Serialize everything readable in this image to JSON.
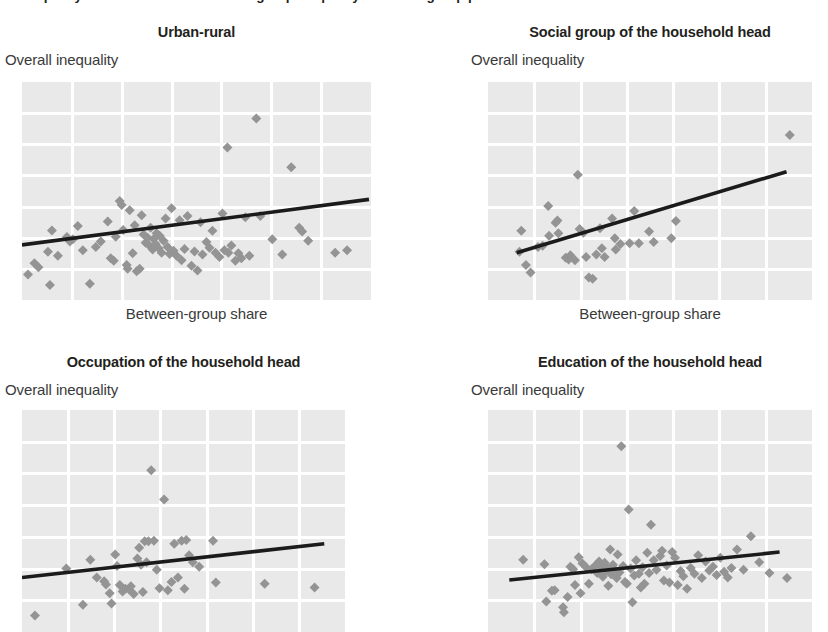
{
  "figure": {
    "caption": "Inequality is correlated with between-group inequality in all four group partitions",
    "y_axis_label": "Overall inequality",
    "x_axis_label": "Between-group share",
    "colors": {
      "plot_background": "#e9e9e9",
      "gridline": "#ffffff",
      "marker": "#949494",
      "trendline": "#1b1b1b",
      "text": "#231f20"
    }
  },
  "chart_data": [
    {
      "type": "scatter",
      "panel": 1,
      "title": "Urban-rural",
      "xlabel": "Between-group share",
      "ylabel": "Overall inequality",
      "grid": true,
      "legend": null,
      "xlim": [
        0,
        7
      ],
      "ylim": [
        0,
        7
      ],
      "grid_cols": 7,
      "grid_rows": 7,
      "trendline": {
        "x0": 0.0,
        "y0": 1.77,
        "x1": 6.96,
        "y1": 3.23
      },
      "points": [
        [
          0.12,
          0.82
        ],
        [
          0.25,
          1.18
        ],
        [
          0.33,
          1.05
        ],
        [
          0.52,
          1.55
        ],
        [
          0.56,
          0.48
        ],
        [
          0.6,
          2.23
        ],
        [
          0.72,
          1.42
        ],
        [
          0.9,
          2.02
        ],
        [
          0.96,
          1.88
        ],
        [
          1.02,
          1.95
        ],
        [
          1.12,
          2.38
        ],
        [
          1.22,
          1.6
        ],
        [
          1.36,
          0.52
        ],
        [
          1.48,
          1.7
        ],
        [
          1.58,
          1.88
        ],
        [
          1.72,
          2.52
        ],
        [
          1.78,
          1.34
        ],
        [
          1.84,
          1.26
        ],
        [
          1.88,
          2.03
        ],
        [
          1.96,
          3.18
        ],
        [
          2.0,
          3.05
        ],
        [
          2.03,
          2.25
        ],
        [
          2.1,
          1.12
        ],
        [
          2.12,
          1.0
        ],
        [
          2.16,
          2.88
        ],
        [
          2.22,
          1.5
        ],
        [
          2.26,
          2.4
        ],
        [
          2.3,
          0.92
        ],
        [
          2.36,
          1.0
        ],
        [
          2.4,
          2.72
        ],
        [
          2.44,
          2.1
        ],
        [
          2.48,
          1.84
        ],
        [
          2.52,
          2.0
        ],
        [
          2.56,
          1.74
        ],
        [
          2.58,
          2.32
        ],
        [
          2.62,
          1.62
        ],
        [
          2.64,
          1.96
        ],
        [
          2.68,
          1.8
        ],
        [
          2.7,
          2.14
        ],
        [
          2.74,
          1.66
        ],
        [
          2.76,
          2.06
        ],
        [
          2.8,
          1.52
        ],
        [
          2.84,
          1.9
        ],
        [
          2.88,
          2.62
        ],
        [
          2.92,
          1.7
        ],
        [
          2.96,
          1.48
        ],
        [
          3.0,
          2.95
        ],
        [
          3.04,
          1.58
        ],
        [
          3.1,
          1.42
        ],
        [
          3.16,
          2.56
        ],
        [
          3.2,
          1.28
        ],
        [
          3.26,
          1.64
        ],
        [
          3.32,
          2.7
        ],
        [
          3.4,
          1.1
        ],
        [
          3.46,
          1.56
        ],
        [
          3.52,
          0.95
        ],
        [
          3.58,
          2.5
        ],
        [
          3.62,
          1.46
        ],
        [
          3.7,
          1.86
        ],
        [
          3.76,
          1.68
        ],
        [
          3.82,
          2.22
        ],
        [
          3.88,
          1.52
        ],
        [
          3.96,
          1.38
        ],
        [
          4.02,
          2.78
        ],
        [
          4.06,
          1.6
        ],
        [
          4.12,
          4.9
        ],
        [
          4.14,
          1.52
        ],
        [
          4.2,
          1.75
        ],
        [
          4.28,
          1.26
        ],
        [
          4.34,
          1.5
        ],
        [
          4.4,
          1.34
        ],
        [
          4.48,
          2.66
        ],
        [
          4.56,
          1.42
        ],
        [
          4.7,
          5.83
        ],
        [
          4.78,
          2.7
        ],
        [
          5.02,
          1.95
        ],
        [
          5.22,
          1.46
        ],
        [
          5.4,
          4.26
        ],
        [
          5.56,
          2.32
        ],
        [
          5.62,
          2.2
        ],
        [
          5.74,
          1.9
        ],
        [
          6.28,
          1.52
        ],
        [
          6.52,
          1.6
        ]
      ]
    },
    {
      "type": "scatter",
      "panel": 2,
      "title": "Social group of the household head",
      "xlabel": "Between-group share",
      "ylabel": "Overall inequality",
      "grid": true,
      "legend": null,
      "xlim": [
        0,
        7
      ],
      "ylim": [
        0,
        7
      ],
      "grid_cols": 7,
      "grid_rows": 7,
      "trendline": {
        "x0": 0.62,
        "y0": 1.52,
        "x1": 6.45,
        "y1": 4.12
      },
      "points": [
        [
          0.68,
          1.55
        ],
        [
          0.72,
          2.22
        ],
        [
          0.82,
          1.12
        ],
        [
          0.92,
          0.88
        ],
        [
          1.08,
          1.7
        ],
        [
          1.18,
          1.74
        ],
        [
          1.3,
          3.02
        ],
        [
          1.32,
          2.06
        ],
        [
          1.46,
          2.48
        ],
        [
          1.5,
          2.55
        ],
        [
          1.52,
          2.14
        ],
        [
          1.68,
          1.36
        ],
        [
          1.74,
          1.3
        ],
        [
          1.78,
          1.44
        ],
        [
          1.88,
          1.28
        ],
        [
          1.94,
          4.02
        ],
        [
          1.98,
          2.28
        ],
        [
          2.06,
          2.16
        ],
        [
          2.12,
          1.38
        ],
        [
          2.18,
          0.72
        ],
        [
          2.26,
          0.68
        ],
        [
          2.34,
          1.46
        ],
        [
          2.42,
          2.3
        ],
        [
          2.46,
          1.66
        ],
        [
          2.52,
          1.38
        ],
        [
          2.68,
          2.62
        ],
        [
          2.74,
          1.98
        ],
        [
          2.76,
          1.62
        ],
        [
          2.86,
          1.8
        ],
        [
          3.06,
          1.82
        ],
        [
          3.16,
          2.86
        ],
        [
          3.26,
          1.82
        ],
        [
          3.48,
          2.2
        ],
        [
          3.58,
          1.86
        ],
        [
          3.96,
          1.98
        ],
        [
          4.06,
          2.54
        ],
        [
          6.52,
          5.3
        ]
      ]
    },
    {
      "type": "scatter",
      "panel": 3,
      "title": "Occupation of the household head",
      "xlabel": "Between-group share",
      "ylabel": "Overall inequality",
      "grid": true,
      "legend": null,
      "xlim": [
        0,
        7
      ],
      "ylim": [
        0,
        7
      ],
      "grid_cols": 7,
      "grid_rows": 7,
      "trendline": {
        "x0": 0.0,
        "y0": 1.72,
        "x1": 6.55,
        "y1": 2.78
      },
      "points": [
        [
          0.28,
          0.52
        ],
        [
          0.96,
          2.0
        ],
        [
          1.32,
          0.86
        ],
        [
          1.48,
          2.28
        ],
        [
          1.62,
          1.72
        ],
        [
          1.78,
          1.6
        ],
        [
          1.82,
          1.5
        ],
        [
          1.9,
          1.22
        ],
        [
          1.94,
          0.9
        ],
        [
          2.02,
          2.44
        ],
        [
          2.06,
          2.08
        ],
        [
          2.12,
          1.48
        ],
        [
          2.18,
          1.28
        ],
        [
          2.24,
          1.36
        ],
        [
          2.32,
          1.34
        ],
        [
          2.36,
          1.44
        ],
        [
          2.42,
          1.2
        ],
        [
          2.5,
          2.32
        ],
        [
          2.54,
          2.66
        ],
        [
          2.58,
          2.12
        ],
        [
          2.62,
          1.26
        ],
        [
          2.66,
          2.86
        ],
        [
          2.7,
          2.2
        ],
        [
          2.74,
          2.86
        ],
        [
          2.8,
          5.1
        ],
        [
          2.86,
          2.88
        ],
        [
          2.92,
          1.96
        ],
        [
          2.98,
          1.38
        ],
        [
          3.08,
          4.18
        ],
        [
          3.16,
          1.32
        ],
        [
          3.24,
          1.58
        ],
        [
          3.3,
          2.78
        ],
        [
          3.38,
          1.72
        ],
        [
          3.46,
          2.88
        ],
        [
          3.52,
          1.36
        ],
        [
          3.56,
          2.9
        ],
        [
          3.62,
          2.42
        ],
        [
          3.7,
          2.2
        ],
        [
          3.84,
          2.06
        ],
        [
          4.14,
          2.88
        ],
        [
          4.2,
          1.56
        ],
        [
          5.26,
          1.52
        ],
        [
          6.34,
          1.4
        ]
      ]
    },
    {
      "type": "scatter",
      "panel": 4,
      "title": "Education of the household head",
      "xlabel": "Between-group share",
      "ylabel": "Overall inequality",
      "grid": true,
      "legend": null,
      "xlim": [
        0,
        7
      ],
      "ylim": [
        0,
        7
      ],
      "grid_cols": 7,
      "grid_rows": 7,
      "trendline": {
        "x0": 0.46,
        "y0": 1.64,
        "x1": 6.3,
        "y1": 2.52
      },
      "points": [
        [
          0.76,
          2.28
        ],
        [
          1.22,
          2.14
        ],
        [
          1.26,
          0.96
        ],
        [
          1.38,
          1.3
        ],
        [
          1.44,
          1.32
        ],
        [
          1.62,
          0.78
        ],
        [
          1.64,
          0.62
        ],
        [
          1.72,
          1.1
        ],
        [
          1.78,
          2.06
        ],
        [
          1.84,
          1.98
        ],
        [
          1.88,
          1.48
        ],
        [
          1.96,
          2.36
        ],
        [
          2.0,
          1.22
        ],
        [
          2.04,
          2.16
        ],
        [
          2.12,
          2.04
        ],
        [
          2.18,
          1.52
        ],
        [
          2.24,
          1.98
        ],
        [
          2.32,
          2.1
        ],
        [
          2.36,
          1.86
        ],
        [
          2.4,
          2.22
        ],
        [
          2.44,
          2.06
        ],
        [
          2.48,
          1.74
        ],
        [
          2.52,
          2.18
        ],
        [
          2.56,
          1.92
        ],
        [
          2.58,
          2.02
        ],
        [
          2.6,
          1.46
        ],
        [
          2.64,
          2.6
        ],
        [
          2.66,
          1.82
        ],
        [
          2.7,
          2.12
        ],
        [
          2.74,
          1.96
        ],
        [
          2.78,
          1.7
        ],
        [
          2.8,
          2.44
        ],
        [
          2.84,
          1.88
        ],
        [
          2.88,
          5.86
        ],
        [
          2.92,
          2.08
        ],
        [
          2.96,
          1.58
        ],
        [
          3.0,
          1.52
        ],
        [
          3.04,
          3.86
        ],
        [
          3.08,
          2.0
        ],
        [
          3.12,
          0.94
        ],
        [
          3.16,
          1.78
        ],
        [
          3.2,
          2.26
        ],
        [
          3.26,
          1.84
        ],
        [
          3.3,
          1.4
        ],
        [
          3.34,
          2.04
        ],
        [
          3.38,
          1.52
        ],
        [
          3.44,
          2.5
        ],
        [
          3.48,
          1.86
        ],
        [
          3.52,
          3.38
        ],
        [
          3.58,
          2.26
        ],
        [
          3.64,
          1.96
        ],
        [
          3.72,
          2.4
        ],
        [
          3.76,
          2.56
        ],
        [
          3.8,
          1.62
        ],
        [
          3.86,
          2.1
        ],
        [
          3.92,
          1.56
        ],
        [
          3.98,
          2.52
        ],
        [
          4.04,
          2.34
        ],
        [
          4.1,
          1.48
        ],
        [
          4.16,
          1.92
        ],
        [
          4.22,
          1.76
        ],
        [
          4.3,
          1.36
        ],
        [
          4.38,
          2.02
        ],
        [
          4.46,
          1.84
        ],
        [
          4.54,
          2.42
        ],
        [
          4.62,
          1.7
        ],
        [
          4.7,
          2.22
        ],
        [
          4.78,
          1.94
        ],
        [
          4.86,
          2.06
        ],
        [
          4.94,
          1.8
        ],
        [
          5.02,
          2.34
        ],
        [
          5.1,
          1.9
        ],
        [
          5.18,
          1.72
        ],
        [
          5.26,
          2.02
        ],
        [
          5.38,
          2.6
        ],
        [
          5.52,
          1.96
        ],
        [
          5.68,
          3.02
        ],
        [
          5.86,
          2.2
        ],
        [
          6.08,
          1.86
        ],
        [
          6.46,
          1.7
        ]
      ]
    }
  ],
  "panels": [
    {
      "name": "urban-rural",
      "title": "Urban-rural",
      "y_label": "Overall inequality",
      "x_label": "Between-group share",
      "show_x_label": true
    },
    {
      "name": "social-group",
      "title": "Social group of the household head",
      "y_label": "Overall inequality",
      "x_label": "Between-group share",
      "show_x_label": true
    },
    {
      "name": "occupation",
      "title": "Occupation of the household head",
      "y_label": "Overall inequality",
      "x_label": "Between-group share",
      "show_x_label": false
    },
    {
      "name": "education",
      "title": "Education of the household head",
      "y_label": "Overall inequality",
      "x_label": "Between-group share",
      "show_x_label": false
    }
  ]
}
